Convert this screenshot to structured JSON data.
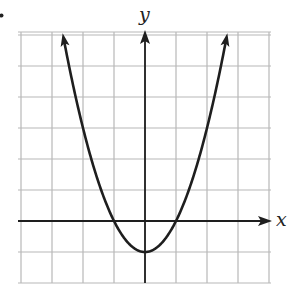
{
  "chart_data": {
    "type": "line",
    "title": "",
    "xlabel": "x",
    "ylabel": "y",
    "function": "y = x^2 - 1",
    "xlim": [
      -4,
      4
    ],
    "ylim": [
      -2,
      6
    ],
    "grid": true,
    "grid_step": 1,
    "legend": null,
    "series": [
      {
        "name": "parabola",
        "x": [
          -2.65,
          -2,
          -1.5,
          -1,
          -0.5,
          0,
          0.5,
          1,
          1.5,
          2,
          2.65
        ],
        "y": [
          6.0,
          3,
          1.25,
          0,
          -0.75,
          -1,
          -0.75,
          0,
          1.25,
          3,
          6.0
        ]
      }
    ],
    "key_points": {
      "vertex": [
        0,
        -1
      ],
      "x_intercepts": [
        -1,
        1
      ],
      "y_intercept": -1
    },
    "arrows": "both curve ends continue upward; axes have arrowheads at positive ends"
  },
  "labels": {
    "x_axis": "x",
    "y_axis": "y"
  },
  "colors": {
    "curve": "#1e1e1e",
    "axes": "#1e1e1e",
    "grid": "#b8b8b8",
    "background": "#ffffff"
  }
}
